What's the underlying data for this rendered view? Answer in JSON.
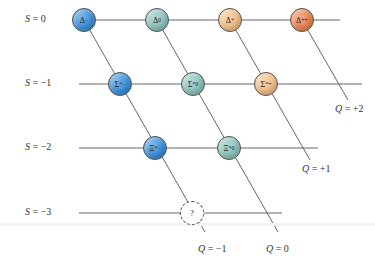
{
  "colors": {
    "q_minus1": "#3a8fd8",
    "q_0": "#8cc4bc",
    "q_plus1": "#f2bf86",
    "q_plus2": "#ec8450",
    "unknown": "#ffffff",
    "line": "#555555"
  },
  "strangeness_rows": [
    {
      "label": "S = 0",
      "y": 20,
      "x_start": 90,
      "x_end": 340
    },
    {
      "label": "S = −1",
      "y": 84,
      "x_start": 79,
      "x_end": 362
    },
    {
      "label": "S = −2",
      "y": 148,
      "x_start": 79,
      "x_end": 318
    },
    {
      "label": "S = −3",
      "y": 213,
      "x_start": 79,
      "x_end": 282
    }
  ],
  "charge_lines": [
    {
      "label": "Q = −1",
      "x1": 84,
      "y1": 20,
      "x2": 205,
      "y2": 232,
      "label_x": 198,
      "label_y": 243
    },
    {
      "label": "Q = 0",
      "x1": 157,
      "y1": 20,
      "x2": 278,
      "y2": 232,
      "label_x": 266,
      "label_y": 243
    },
    {
      "label": "Q = +1",
      "x1": 230,
      "y1": 20,
      "x2": 310,
      "y2": 160,
      "label_x": 302,
      "label_y": 163
    },
    {
      "label": "Q = +2",
      "x1": 302,
      "y1": 20,
      "x2": 348,
      "y2": 100,
      "label_x": 335,
      "label_y": 103
    }
  ],
  "particles": [
    {
      "name": "delta-minus",
      "symbol": "Δ",
      "sup": "−",
      "x": 84,
      "y": 20,
      "charge": "q_minus1"
    },
    {
      "name": "delta-zero",
      "symbol": "Δ",
      "sup": "0",
      "x": 157,
      "y": 20,
      "charge": "q_0"
    },
    {
      "name": "delta-plus",
      "symbol": "Δ",
      "sup": "+",
      "x": 230,
      "y": 20,
      "charge": "q_plus1"
    },
    {
      "name": "delta-plus-plus",
      "symbol": "Δ",
      "sup": "++",
      "x": 302,
      "y": 20,
      "charge": "q_plus2"
    },
    {
      "name": "sigma-star-minus",
      "symbol": "Σ",
      "sup": "*−",
      "x": 120,
      "y": 84,
      "charge": "q_minus1"
    },
    {
      "name": "sigma-star-zero",
      "symbol": "Σ",
      "sup": "*0",
      "x": 193,
      "y": 84,
      "charge": "q_0"
    },
    {
      "name": "sigma-star-plus",
      "symbol": "Σ",
      "sup": "*+",
      "x": 266,
      "y": 84,
      "charge": "q_plus1"
    },
    {
      "name": "xi-star-minus",
      "symbol": "Ξ",
      "sup": "*−",
      "x": 155,
      "y": 148,
      "charge": "q_minus1"
    },
    {
      "name": "xi-star-zero",
      "symbol": "Ξ",
      "sup": "*0",
      "x": 229,
      "y": 148,
      "charge": "q_0"
    },
    {
      "name": "unknown-particle",
      "symbol": "?",
      "sup": "",
      "x": 192,
      "y": 213,
      "charge": "unknown"
    }
  ]
}
